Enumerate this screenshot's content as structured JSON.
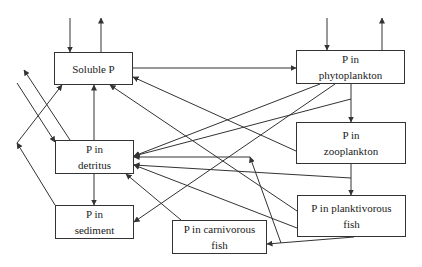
{
  "diagram": {
    "type": "phosphorus-flow-diagram",
    "nodes": [
      {
        "id": "soluble_p",
        "label": "Soluble P",
        "x": 54,
        "y": 52,
        "w": 79,
        "h": 33
      },
      {
        "id": "phytoplankton",
        "label": "P in\nphytoplankton",
        "x": 296,
        "y": 50,
        "w": 109,
        "h": 34
      },
      {
        "id": "detritus",
        "label": "P in\ndetritus",
        "x": 55,
        "y": 140,
        "w": 79,
        "h": 34
      },
      {
        "id": "zooplankton",
        "label": "P in\nzooplankton",
        "x": 296,
        "y": 122,
        "w": 110,
        "h": 42
      },
      {
        "id": "sediment",
        "label": "P in\nsediment",
        "x": 55,
        "y": 205,
        "w": 79,
        "h": 34
      },
      {
        "id": "planktivorous_fish",
        "label": "P in planktivorous\nfish",
        "x": 297,
        "y": 195,
        "w": 109,
        "h": 42
      },
      {
        "id": "carnivorous_fish",
        "label": "P in carnivorous\nfish",
        "x": 172,
        "y": 220,
        "w": 95,
        "h": 34
      }
    ],
    "edges": [
      {
        "from": "external",
        "to": "soluble_p",
        "points": [
          [
            70,
            18
          ],
          [
            70,
            52
          ]
        ],
        "arrow": "end"
      },
      {
        "from": "soluble_p",
        "to": "external",
        "points": [
          [
            101,
            52
          ],
          [
            101,
            18
          ]
        ],
        "arrow": "end"
      },
      {
        "from": "external",
        "to": "phytoplankton",
        "points": [
          [
            327,
            18
          ],
          [
            327,
            50
          ]
        ],
        "arrow": "end"
      },
      {
        "from": "phytoplankton",
        "to": "external",
        "points": [
          [
            382,
            50
          ],
          [
            382,
            18
          ]
        ],
        "arrow": "end"
      },
      {
        "from": "soluble_p",
        "to": "phytoplankton",
        "points": [
          [
            133,
            68
          ],
          [
            296,
            68
          ]
        ],
        "arrow": "end"
      },
      {
        "from": "phytoplankton",
        "to": "zooplankton",
        "points": [
          [
            351,
            84
          ],
          [
            351,
            122
          ]
        ],
        "arrow": "end"
      },
      {
        "from": "zooplankton",
        "to": "planktivorous_fish",
        "points": [
          [
            351,
            164
          ],
          [
            351,
            195
          ]
        ],
        "arrow": "end"
      },
      {
        "from": "planktivorous_fish",
        "to": "carnivorous_fish",
        "points": [
          [
            354,
            237
          ],
          [
            267,
            244
          ]
        ],
        "arrow": "end"
      },
      {
        "from": "detritus",
        "to": "soluble_p",
        "points": [
          [
            94,
            140
          ],
          [
            94,
            85
          ]
        ],
        "arrow": "end"
      },
      {
        "from": "detritus",
        "to": "sediment",
        "points": [
          [
            94,
            174
          ],
          [
            94,
            205
          ]
        ],
        "arrow": "end"
      },
      {
        "from": "zooplankton",
        "to": "soluble_p",
        "points": [
          [
            296,
            151
          ],
          [
            133,
            77
          ]
        ],
        "arrow": "end"
      },
      {
        "from": "planktivorous_fish",
        "to": "soluble_p",
        "points": [
          [
            297,
            211
          ],
          [
            110,
            85
          ]
        ],
        "arrow": "end"
      },
      {
        "from": "phytoplankton",
        "to": "detritus",
        "points": [
          [
            320,
            84
          ],
          [
            134,
            156
          ]
        ],
        "arrow": "end"
      },
      {
        "from": "phytoplankton_link",
        "to": "detritus",
        "points": [
          [
            351,
            99
          ],
          [
            134,
            156
          ]
        ],
        "arrow": "end"
      },
      {
        "from": "phytoplankton",
        "to": "sediment",
        "points": [
          [
            335,
            84
          ],
          [
            134,
            222
          ]
        ],
        "arrow": "end"
      },
      {
        "from": "zooplankton_link",
        "to": "detritus",
        "points": [
          [
            351,
            178
          ],
          [
            134,
            165
          ]
        ],
        "arrow": "end"
      },
      {
        "from": "planktivorous_fish",
        "to": "detritus",
        "points": [
          [
            297,
            228
          ],
          [
            134,
            165
          ]
        ],
        "arrow": "end"
      },
      {
        "from": "carnivorous_fish",
        "to": "detritus",
        "points": [
          [
            181,
            220
          ],
          [
            126,
            174
          ]
        ],
        "arrow": "end"
      },
      {
        "from": "fish_link",
        "to": "detritus",
        "points": [
          [
            281,
            243
          ],
          [
            250,
            157
          ]
        ],
        "arrow": "end"
      },
      {
        "from": "fish_link_h",
        "to": "detritus",
        "points": [
          [
            250,
            157
          ],
          [
            134,
            157
          ]
        ],
        "arrow": "end"
      },
      {
        "from": "external",
        "to": "detritus",
        "points": [
          [
            17,
            83
          ],
          [
            55,
            142
          ]
        ],
        "arrow": "end"
      },
      {
        "from": "detritus",
        "to": "external",
        "points": [
          [
            70,
            140
          ],
          [
            24,
            70
          ]
        ],
        "arrow": "end"
      },
      {
        "from": "sediment",
        "to": "outside",
        "points": [
          [
            55,
            205
          ],
          [
            17,
            143
          ]
        ],
        "arrow": "end"
      },
      {
        "from": "outside",
        "to": "soluble_p",
        "points": [
          [
            17,
            143
          ],
          [
            62,
            85
          ]
        ],
        "arrow": "end"
      }
    ],
    "colors": {
      "line": "#333333",
      "box_border": "#333333",
      "text": "#222222",
      "background": "#ffffff"
    }
  }
}
